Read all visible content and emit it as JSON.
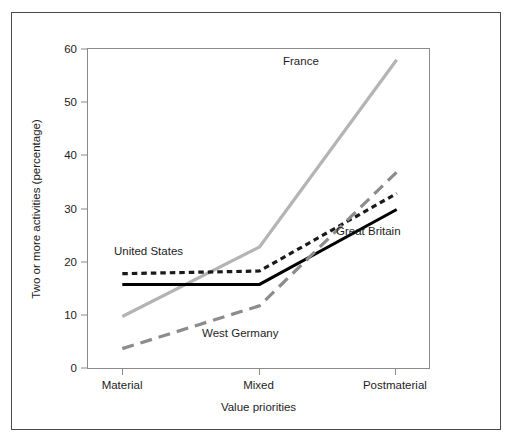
{
  "figure": {
    "border_color": "#4a4a4a",
    "background": "#ffffff"
  },
  "axes": {
    "ylabel": "Two or more activities (percentage)",
    "xlabel": "Value priorities",
    "yticks": [
      "0",
      "10",
      "20",
      "30",
      "40",
      "50",
      "60"
    ],
    "xticks": [
      "Material",
      "Mixed",
      "Postmaterial"
    ]
  },
  "series_labels": {
    "united_states": "United States",
    "france": "France",
    "great_britain": "Great Britain",
    "west_germany": "West Germany"
  },
  "chart_data": {
    "type": "line",
    "title": "",
    "subtitle": "",
    "xlabel": "Value priorities",
    "ylabel": "Two or more activities (percentage)",
    "categories": [
      "Material",
      "Mixed",
      "Postmaterial"
    ],
    "ylim": [
      0,
      60
    ],
    "yticks": [
      0,
      10,
      20,
      30,
      40,
      50,
      60
    ],
    "grid": false,
    "legend_position": "inline-annotations",
    "series": [
      {
        "name": "France",
        "values": [
          10,
          23,
          58
        ],
        "color": "#b4b4b4",
        "style": "solid",
        "width": 3.2
      },
      {
        "name": "United States",
        "values": [
          18,
          18.5,
          33
        ],
        "color": "#1a1a1a",
        "style": "dotted",
        "width": 3.2
      },
      {
        "name": "Great Britain",
        "values": [
          16,
          16,
          30
        ],
        "color": "#000000",
        "style": "solid",
        "width": 3.0
      },
      {
        "name": "West Germany",
        "values": [
          4,
          12,
          37
        ],
        "color": "#8c8c8c",
        "style": "dashed",
        "width": 3.2
      }
    ],
    "annotations": [
      {
        "text": "France",
        "category": "Postmaterial",
        "value": 55
      },
      {
        "text": "United States",
        "category": "Material",
        "value": 21
      },
      {
        "text": "Great Britain",
        "category": "Postmaterial",
        "value": 24
      },
      {
        "text": "West Germany",
        "category": "Mixed",
        "value": 8
      }
    ]
  }
}
